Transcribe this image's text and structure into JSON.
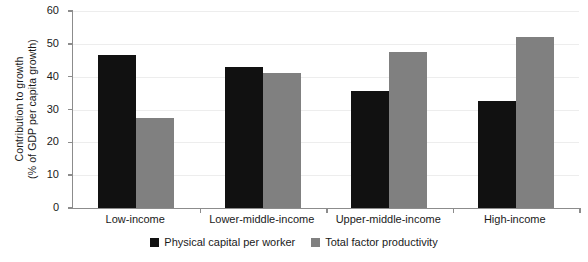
{
  "chart_data": {
    "type": "bar",
    "title": "",
    "xlabel": "",
    "ylabel": "Contribution to growth (% of GDP per capita growth)",
    "ylabel_line1": "Contribution to growth",
    "ylabel_line2": "(% of GDP per capita growth)",
    "ylim": [
      0,
      60
    ],
    "yticks": [
      0,
      10,
      20,
      30,
      40,
      50,
      60
    ],
    "ytick_labels": [
      "0",
      "10",
      "20",
      "30",
      "40",
      "50",
      "60"
    ],
    "grid": true,
    "grid_axis": "y",
    "legend_position": "bottom-center",
    "categories": [
      "Low-income",
      "Lower-middle-income",
      "Upper-middle-income",
      "High-income"
    ],
    "series": [
      {
        "name": "Physical capital per worker",
        "color": "#111111",
        "values": [
          46.5,
          43.0,
          35.5,
          32.5
        ]
      },
      {
        "name": "Total factor productivity",
        "color": "#808080",
        "values": [
          27.3,
          41.0,
          47.5,
          52.0
        ]
      }
    ]
  }
}
